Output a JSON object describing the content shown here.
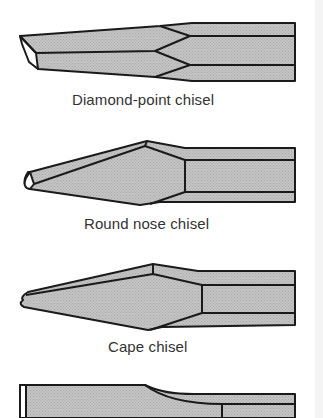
{
  "figure": {
    "colors": {
      "fill": "#bdbdbd",
      "stroke": "#1a1a1a",
      "label": "#333333",
      "background": "#ffffff"
    },
    "chisels": [
      {
        "name": "diamond-point-chisel",
        "label": "Diamond-point chisel"
      },
      {
        "name": "round-nose-chisel",
        "label": "Round nose chisel"
      },
      {
        "name": "cape-chisel",
        "label": "Cape chisel"
      },
      {
        "name": "flat-chisel-partial",
        "label": ""
      }
    ]
  }
}
